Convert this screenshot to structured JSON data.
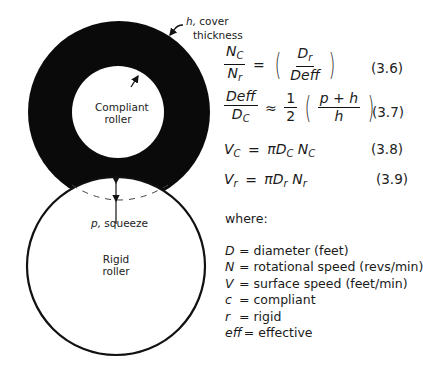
{
  "diagram": {
    "labels": {
      "cover": "h, cover",
      "cover_sym": "h,",
      "cover_rest": " cover",
      "cover_line2": "thickness",
      "compliant_line1": "Compliant",
      "compliant_line2": "roller",
      "squeeze_sym": "p,",
      "squeeze_rest": " squeeze",
      "rigid_line1": "Rigid",
      "rigid_line2": "roller"
    },
    "colors": {
      "cover": "#0a0a0a",
      "outline": "#111111",
      "background": "#ffffff"
    }
  },
  "equations": [
    {
      "id": "3.6",
      "lhs_num": "N",
      "lhs_num_sub": "C",
      "lhs_den": "N",
      "lhs_den_sub": "r",
      "op": "=",
      "rhs_num": "D",
      "rhs_num_sub": "r",
      "rhs_den": "Deff",
      "number": "(3.6)"
    },
    {
      "id": "3.7",
      "lhs_num": "Deff",
      "lhs_den": "D",
      "lhs_den_sub": "C",
      "op": "≈",
      "coef_num": "1",
      "coef_den": "2",
      "rhs_num": "p + h",
      "rhs_den": "h",
      "number": "(3.7)"
    },
    {
      "id": "3.8",
      "lhs": "V",
      "lhs_sub": "C",
      "op": "=",
      "rhs_pi": "π",
      "rhs_d": "D",
      "rhs_d_sub": "C",
      "rhs_n": "N",
      "rhs_n_sub": "C",
      "number": "(3.8)"
    },
    {
      "id": "3.9",
      "lhs": "V",
      "lhs_sub": "r",
      "op": "=",
      "rhs_pi": "π",
      "rhs_d": "D",
      "rhs_d_sub": "r",
      "rhs_n": "N",
      "rhs_n_sub": "r",
      "number": "(3.9)"
    }
  ],
  "where_label": "where:",
  "definitions": [
    {
      "symbol": "D",
      "eq": "=",
      "meaning": "diameter (feet)"
    },
    {
      "symbol": "N",
      "eq": "=",
      "meaning": "rotational speed (revs/min)"
    },
    {
      "symbol": "V",
      "eq": "=",
      "meaning": "surface speed (feet/min)"
    },
    {
      "symbol": "c",
      "eq": "=",
      "meaning": "compliant"
    },
    {
      "symbol": "r",
      "eq": "=",
      "meaning": "rigid"
    },
    {
      "symbol": "eff",
      "eq": "=",
      "meaning": "effective"
    }
  ]
}
